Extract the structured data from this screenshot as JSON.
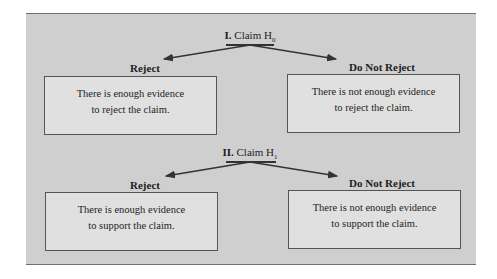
{
  "diagram": {
    "sections": [
      {
        "numeral": "I.",
        "claim_text": "Claim H",
        "claim_sub": "0",
        "left": {
          "label": "Reject",
          "line1": "There is enough evidence",
          "line2": "to reject the claim."
        },
        "right": {
          "label": "Do Not Reject",
          "line1": "There is not enough evidence",
          "line2": "to reject the claim."
        }
      },
      {
        "numeral": "II.",
        "claim_text": "Claim H",
        "claim_sub": "1",
        "left": {
          "label": "Reject",
          "line1": "There is enough evidence",
          "line2": "to support the claim."
        },
        "right": {
          "label": "Do Not Reject",
          "line1": "There is not enough evidence",
          "line2": "to support the claim."
        }
      }
    ],
    "colors": {
      "panel": "#cfcfcf",
      "box": "#e0e0e0",
      "border": "#555555"
    }
  }
}
